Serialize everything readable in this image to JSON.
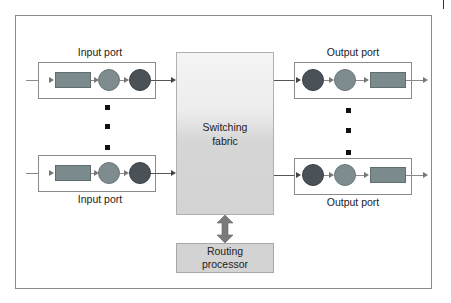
{
  "diagram": {
    "type": "router-architecture",
    "input_ports": [
      {
        "label": "Input port",
        "label_position": "above"
      },
      {
        "label": "Input port",
        "label_position": "below"
      }
    ],
    "output_ports": [
      {
        "label": "Output port",
        "label_position": "above"
      },
      {
        "label": "Output port",
        "label_position": "below"
      }
    ],
    "switching_fabric": {
      "line1": "Switching",
      "line2": "fabric"
    },
    "routing_processor": {
      "line1": "Routing",
      "line2": "processor"
    },
    "colors": {
      "queue": "#7b8a8c",
      "circle_mid": "#7e8b8f",
      "circle_dark": "#4a5257",
      "fabric_top": "#f4f4f4",
      "fabric_bottom": "#d3d3d3",
      "routing_fill": "#d3d3d3",
      "arrow": "#777777",
      "border": "#8a8a8a"
    }
  }
}
